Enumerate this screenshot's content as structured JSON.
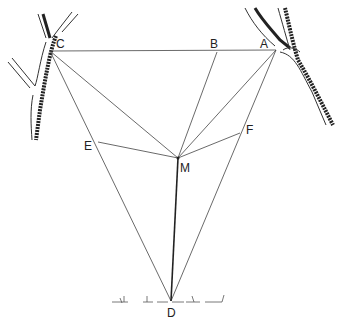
{
  "diagram": {
    "type": "geometric surveying sketch between two trees",
    "points": {
      "A": {
        "label": "A",
        "x": 276,
        "y": 50
      },
      "B": {
        "label": "B",
        "x": 217,
        "y": 52
      },
      "C": {
        "label": "C",
        "x": 50,
        "y": 51
      },
      "D": {
        "label": "D",
        "x": 171,
        "y": 301
      },
      "E": {
        "label": "E",
        "x": 98,
        "y": 142
      },
      "F": {
        "label": "F",
        "x": 240,
        "y": 133
      },
      "M": {
        "label": "M",
        "x": 178,
        "y": 158
      }
    },
    "segments": [
      [
        "C",
        "A"
      ],
      [
        "C",
        "D"
      ],
      [
        "A",
        "D"
      ],
      [
        "C",
        "M"
      ],
      [
        "A",
        "M"
      ],
      [
        "B",
        "M"
      ],
      [
        "E",
        "M"
      ],
      [
        "F",
        "M"
      ],
      [
        "M",
        "D"
      ]
    ],
    "labels": {
      "A": "A",
      "B": "B",
      "C": "C",
      "D": "D",
      "E": "E",
      "F": "F",
      "M": "M"
    }
  }
}
